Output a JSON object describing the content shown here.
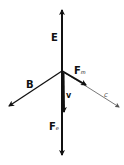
{
  "diagram": {
    "type": "vector-diagram",
    "origin": [
      62,
      71
    ],
    "vectors": [
      {
        "id": "E",
        "label": "E",
        "subscript": "",
        "from": [
          62,
          71
        ],
        "to": [
          62,
          10
        ],
        "weight": "thick"
      },
      {
        "id": "Fe",
        "label": "F",
        "subscript": "e",
        "from": [
          62,
          71
        ],
        "to": [
          62,
          155
        ],
        "weight": "thick"
      },
      {
        "id": "B",
        "label": "B",
        "subscript": "",
        "from": [
          62,
          71
        ],
        "to": [
          8,
          107
        ],
        "weight": "medium"
      },
      {
        "id": "c",
        "label": "c",
        "subscript": "",
        "from": [
          62,
          71
        ],
        "to": [
          120,
          108
        ],
        "weight": "thin"
      },
      {
        "id": "Fm",
        "label": "F",
        "subscript": "m",
        "from": [
          62,
          71
        ],
        "to": [
          86,
          85
        ],
        "weight": "thick"
      },
      {
        "id": "v",
        "label": "v",
        "subscript": "",
        "from": [
          63,
          71
        ],
        "to": [
          64,
          112
        ],
        "weight": "thick"
      }
    ],
    "colors": {
      "stroke": "#111111",
      "thin": "#555555",
      "background": "#ffffff"
    }
  }
}
